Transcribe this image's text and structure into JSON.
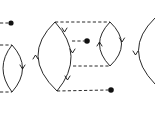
{
  "diagram": {
    "type": "feynman-diagram-fragment",
    "colors": {
      "stroke": "#111111",
      "background": "#ffffff"
    },
    "diagrams": [
      {
        "id": "left-partial",
        "loops": [
          {
            "top": [
              12,
              45
            ],
            "bottom": [
              12,
              92
            ],
            "right_x": 23,
            "arrows": [
              {
                "side": "right",
                "dir": "down"
              }
            ]
          }
        ],
        "dashed_lines": [
          {
            "from": [
              0,
              23
            ],
            "to": [
              8,
              23
            ],
            "ends_in_dot": true
          },
          {
            "from": [
              0,
              45
            ],
            "to": [
              12,
              45
            ]
          },
          {
            "from": [
              0,
              92
            ],
            "to": [
              12,
              92
            ]
          }
        ],
        "dots": [
          [
            11,
            23
          ]
        ]
      },
      {
        "id": "center",
        "loops": [
          {
            "top": [
              55,
              22
            ],
            "bottom": [
              57,
              91
            ],
            "left_x": 35,
            "right_x": 73,
            "arrows": [
              {
                "side": "left",
                "dir": "up"
              },
              {
                "side": "right",
                "dir": "down"
              },
              {
                "side": "right",
                "dir": "down"
              },
              {
                "side": "right",
                "dir": "down"
              }
            ]
          },
          {
            "top": [
              110,
              22
            ],
            "bottom": [
              110,
              66
            ],
            "left_x": 98,
            "right_x": 122,
            "arrows": [
              {
                "side": "left",
                "dir": "up"
              },
              {
                "side": "right",
                "dir": "down"
              }
            ]
          }
        ],
        "dashed_lines": [
          {
            "from": [
              55,
              22
            ],
            "to": [
              110,
              22
            ]
          },
          {
            "from": [
              72,
              41
            ],
            "to": [
              86,
              41
            ],
            "ends_in_dot": true
          },
          {
            "from": [
              73,
              66
            ],
            "to": [
              110,
              66
            ]
          },
          {
            "from": [
              57,
              91
            ],
            "to": [
              110,
              90
            ],
            "ends_in_dot": true
          }
        ],
        "dots": [
          [
            87,
            41
          ],
          [
            111,
            90
          ]
        ]
      },
      {
        "id": "right-partial",
        "loops": [
          {
            "top": [
              155,
              18
            ],
            "left_x": 136,
            "arrows": [
              {
                "side": "left",
                "dir": "down"
              }
            ]
          }
        ],
        "dashed_lines": [],
        "dots": []
      }
    ]
  }
}
